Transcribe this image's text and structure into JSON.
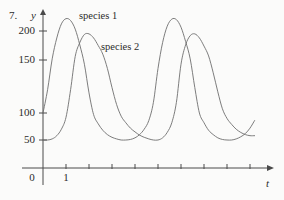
{
  "figure": {
    "problem_number": "7.",
    "y_axis_label": "y",
    "x_axis_label": "t",
    "origin_label": "0"
  },
  "annotations": {
    "curve1_label": "species 1",
    "curve2_label": "species 2"
  },
  "style": {
    "line_color": "#6e6e6e",
    "axis_color": "#4a4a4a",
    "text_color": "#2b2b2b",
    "background": "#fbfbfa"
  },
  "chart_data": {
    "type": "line",
    "title": "",
    "xlabel": "t",
    "ylabel": "y",
    "grid": false,
    "legend": "inline-annotation",
    "xlim": [
      0,
      10
    ],
    "ylim": [
      0,
      240
    ],
    "xticks": [
      1,
      2,
      3,
      4,
      5,
      6,
      7,
      8,
      9,
      10
    ],
    "xtick_labels": [
      "1",
      "",
      "",
      "",
      "",
      "",
      "",
      "",
      "",
      ""
    ],
    "yticks": [
      50,
      100,
      150,
      200
    ],
    "ytick_labels": [
      "50",
      "100",
      "150",
      "200"
    ],
    "series": [
      {
        "name": "species 1",
        "color": "#6e6e6e",
        "x": [
          0.0,
          0.2,
          0.4,
          0.6,
          0.8,
          1.0,
          1.2,
          1.4,
          1.6,
          1.8,
          2.0,
          2.2,
          2.4,
          2.6,
          2.8,
          3.0,
          3.2,
          3.4,
          3.6,
          3.8,
          4.0,
          4.2,
          4.4,
          4.6,
          4.8,
          5.0,
          5.2,
          5.4,
          5.6,
          5.8,
          6.0,
          6.2,
          6.4,
          6.6,
          6.8,
          7.0,
          7.2,
          7.4,
          7.6,
          7.8,
          8.0,
          8.2,
          8.4,
          8.6,
          8.8,
          9.0,
          9.2
        ],
        "y": [
          100,
          122,
          152,
          188,
          215,
          226,
          222,
          204,
          176,
          146,
          119,
          97,
          80,
          68,
          60,
          55,
          52,
          50,
          50,
          51,
          54,
          60,
          70,
          86,
          110,
          142,
          180,
          210,
          225,
          224,
          208,
          182,
          152,
          124,
          100,
          82,
          68,
          60,
          54,
          51,
          50,
          50,
          52,
          56,
          62,
          72,
          86
        ]
      },
      {
        "name": "species 2",
        "color": "#6e6e6e",
        "x": [
          0.0,
          0.2,
          0.4,
          0.6,
          0.8,
          1.0,
          1.2,
          1.4,
          1.6,
          1.8,
          2.0,
          2.2,
          2.4,
          2.6,
          2.8,
          3.0,
          3.2,
          3.4,
          3.6,
          3.8,
          4.0,
          4.2,
          4.4,
          4.6,
          4.8,
          5.0,
          5.2,
          5.4,
          5.6,
          5.8,
          6.0,
          6.2,
          6.4,
          6.6,
          6.8,
          7.0,
          7.2,
          7.4,
          7.6,
          7.8,
          8.0,
          8.2,
          8.4,
          8.6,
          8.8,
          9.0,
          9.2
        ],
        "y": [
          50,
          50,
          52,
          58,
          70,
          92,
          122,
          156,
          180,
          194,
          195,
          188,
          175,
          160,
          142,
          124,
          108,
          94,
          82,
          72,
          65,
          59,
          55,
          52,
          50,
          50,
          54,
          64,
          82,
          110,
          146,
          176,
          192,
          195,
          188,
          174,
          157,
          138,
          120,
          104,
          90,
          79,
          70,
          64,
          60,
          58,
          58
        ]
      }
    ],
    "notes": {
      "curve1_initial_value": 100,
      "curve2_initial_value": 50,
      "curve1_peak_value": 226,
      "curve2_peak_value": 195,
      "curve_min_value": 50,
      "period": 5
    }
  }
}
